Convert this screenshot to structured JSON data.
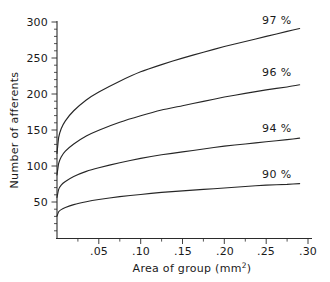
{
  "chart_data": {
    "type": "line",
    "title": "",
    "xlabel": "Area of group (mm²)",
    "ylabel": "Number of afferents",
    "xlim": [
      0,
      0.305
    ],
    "ylim": [
      0,
      305
    ],
    "grid": false,
    "legend_position": "inline-right-of-curve-end",
    "xticks": [
      0.05,
      0.1,
      0.15,
      0.2,
      0.25,
      0.3
    ],
    "xtick_labels": [
      ".05",
      ".10",
      ".15",
      ".20",
      ".25",
      ".30"
    ],
    "yticks": [
      50,
      100,
      150,
      200,
      250,
      300
    ],
    "ytick_labels": [
      "50",
      "100",
      "150",
      "200",
      "250",
      "300"
    ],
    "series": [
      {
        "name": "97 %",
        "label": "97 %",
        "x": [
          0.0,
          0.002,
          0.005,
          0.01,
          0.02,
          0.035,
          0.05,
          0.075,
          0.1,
          0.125,
          0.15,
          0.175,
          0.2,
          0.225,
          0.25,
          0.275,
          0.29
        ],
        "values": [
          118,
          140,
          152,
          163,
          177,
          192,
          203,
          218,
          231,
          241,
          250,
          258,
          266,
          273,
          280,
          287,
          291
        ]
      },
      {
        "name": "96 %",
        "label": "96 %",
        "x": [
          0.0,
          0.002,
          0.005,
          0.01,
          0.02,
          0.035,
          0.05,
          0.075,
          0.1,
          0.125,
          0.15,
          0.175,
          0.2,
          0.225,
          0.25,
          0.275,
          0.29
        ],
        "values": [
          88,
          104,
          113,
          121,
          131,
          142,
          150,
          161,
          170,
          178,
          184,
          190,
          196,
          201,
          206,
          210,
          213
        ]
      },
      {
        "name": "94 %",
        "label": "94 %",
        "x": [
          0.0,
          0.002,
          0.005,
          0.01,
          0.02,
          0.035,
          0.05,
          0.075,
          0.1,
          0.125,
          0.15,
          0.175,
          0.2,
          0.225,
          0.25,
          0.275,
          0.29
        ],
        "values": [
          57,
          68,
          74,
          79,
          86,
          93,
          98,
          105,
          111,
          116,
          120,
          124,
          128,
          131,
          134,
          137,
          139
        ]
      },
      {
        "name": "90 %",
        "label": "90 %",
        "x": [
          0.0,
          0.002,
          0.005,
          0.01,
          0.02,
          0.035,
          0.05,
          0.075,
          0.1,
          0.125,
          0.15,
          0.175,
          0.2,
          0.225,
          0.25,
          0.275,
          0.29
        ],
        "values": [
          31,
          37,
          40,
          43,
          47,
          51,
          54,
          58,
          61,
          64,
          66,
          68,
          70,
          72,
          74,
          75,
          76
        ]
      }
    ]
  },
  "axes": {
    "y_title": "Number of afferents",
    "x_title_main": "Area of group (mm",
    "x_title_sup": "2",
    "x_title_tail": ")"
  },
  "ytick_labels": {
    "t300": "300",
    "t250": "250",
    "t200": "200",
    "t150": "150",
    "t100": "100",
    "t50": "50"
  },
  "xtick_labels": {
    "t05": ".05",
    "t10": ".10",
    "t15": ".15",
    "t20": ".20",
    "t25": ".25",
    "t30": ".30"
  },
  "series_labels": {
    "s97": "97 %",
    "s96": "96 %",
    "s94": "94 %",
    "s90": "90 %"
  },
  "colors": {
    "ink": "#262626",
    "background": "#ffffff"
  }
}
